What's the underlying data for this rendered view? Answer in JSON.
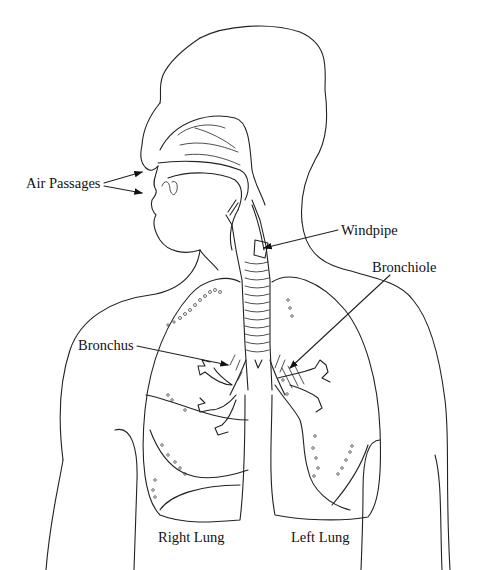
{
  "figure": {
    "background": "#ffffff",
    "line_color": "#222222"
  },
  "labels": {
    "air_passages": "Air Passages",
    "windpipe": "Windpipe",
    "bronchiole": "Bronchiole",
    "bronchus": "Bronchus",
    "right_lung": "Right Lung",
    "left_lung": "Left Lung"
  }
}
